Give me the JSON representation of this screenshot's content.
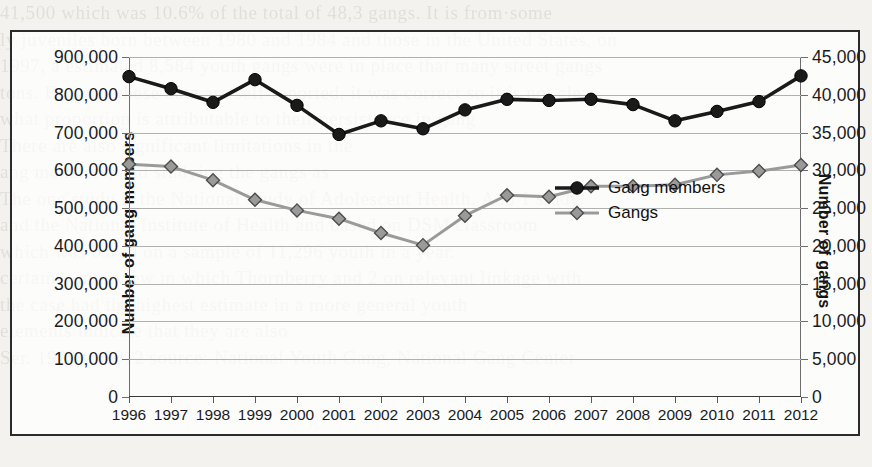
{
  "page": {
    "background_note": "scanned book page with faint bleed-through text behind the chart",
    "bleed_lines": [
      "41,500 which was 10.6% of the total of 48,3 gangs. It is from·some",
      "ly juveniles born between 1980 and 1984 and those in the United States, on",
      "1997, a estimated 8,584 youth gangs were in place that many street gangs",
      "tons. Because these data are self-reported, it was correct so it is not clear",
      "what proportion is attributable to their persistence in gang",
      "There are also significant limitations in the",
      "ang members, and studying the gangs as",
      "The one study is the National Study of Adolescent Health. Add 1 study",
      "and the National Institute of Health and based on DSM classroom",
      "which was based on a sample of 11,296 youth in a year.",
      "certainty interview in which Thornberry and 2 on relevant linkage with",
      "the case had the highest estimate in a more general youth",
      "elements indicate that they are also",
      "Ser. 1989 to 2012 source: National Youth Gang, National Gang Center"
    ]
  },
  "chart_data": {
    "type": "line",
    "title": "",
    "xlabel": "",
    "ylabel": "Number of gang members",
    "ylabel_secondary": "Number of gangs",
    "grid": true,
    "legend_position": "center",
    "categories": [
      "1996",
      "1997",
      "1998",
      "1999",
      "2000",
      "2001",
      "2002",
      "2003",
      "2004",
      "2005",
      "2006",
      "2007",
      "2008",
      "2009",
      "2010",
      "2011",
      "2012"
    ],
    "axes": {
      "left": {
        "label": "Number of gang members",
        "ticks": [
          "0",
          "100,000",
          "200,000",
          "300,000",
          "400,000",
          "500,000",
          "600,000",
          "700,000",
          "800,000",
          "900,000"
        ],
        "tick_values": [
          0,
          100000,
          200000,
          300000,
          400000,
          500000,
          600000,
          700000,
          800000,
          900000
        ],
        "min": 0,
        "max": 900000,
        "step": 100000
      },
      "right": {
        "label": "Number of gangs",
        "ticks": [
          "0",
          "5,000",
          "10,000",
          "15,000",
          "20,000",
          "25,000",
          "30,000",
          "35,000",
          "40,000",
          "45,000"
        ],
        "tick_values": [
          0,
          5000,
          10000,
          15000,
          20000,
          25000,
          30000,
          35000,
          40000,
          45000
        ],
        "min": 0,
        "max": 45000,
        "step": 5000
      }
    },
    "series": [
      {
        "name": "Gang members",
        "axis": "left",
        "color": "#1a1a1a",
        "marker": "circle",
        "values": [
          848000,
          816000,
          780000,
          840000,
          772000,
          695000,
          731000,
          710000,
          760000,
          788000,
          785000,
          788000,
          774000,
          731000,
          756000,
          782000,
          850000
        ]
      },
      {
        "name": "Gangs",
        "axis": "right",
        "color": "#9a9a9a",
        "marker": "diamond",
        "values": [
          30800,
          30500,
          28700,
          26100,
          24700,
          23600,
          21700,
          20100,
          24000,
          26700,
          26500,
          27900,
          27900,
          28100,
          29400,
          29900,
          30700
        ]
      }
    ],
    "legend": [
      {
        "label": "Gang members",
        "color": "#1a1a1a",
        "marker": "circle"
      },
      {
        "label": "Gangs",
        "color": "#9a9a9a",
        "marker": "diamond"
      }
    ]
  }
}
